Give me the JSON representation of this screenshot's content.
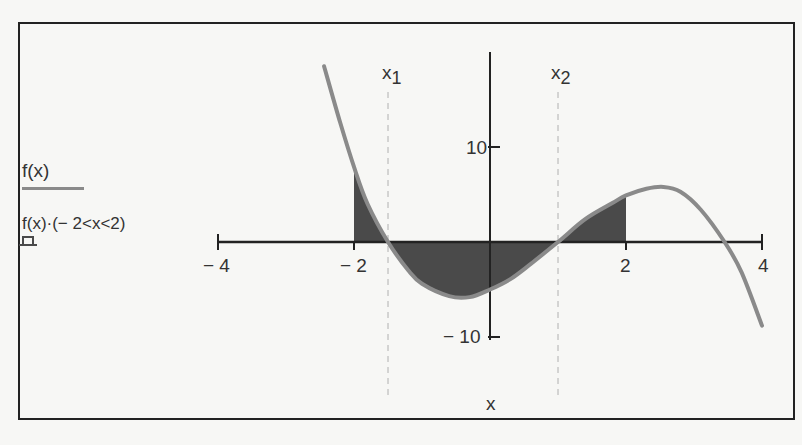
{
  "chart_data": {
    "type": "line",
    "title": "",
    "xlabel": "x",
    "ylabel": "",
    "xlim": [
      -4,
      4
    ],
    "ylim": [
      -10,
      20
    ],
    "grid": false,
    "x_ticks": [
      -4,
      -2,
      2,
      4
    ],
    "x_tick_labels": [
      "− 4",
      "− 2",
      "2",
      "4"
    ],
    "y_ticks": [
      10,
      -10
    ],
    "y_tick_labels": [
      "10",
      "− 10"
    ],
    "legend_position": "left",
    "markers": [
      {
        "name": "x1",
        "label_base": "x",
        "label_sub": "1",
        "x": -1.5,
        "style": "dashed"
      },
      {
        "name": "x2",
        "label_base": "x",
        "label_sub": "2",
        "x": 1.0,
        "style": "dashed"
      }
    ],
    "series": [
      {
        "name": "f(x)",
        "legend_label": "f(x)",
        "style": "line",
        "color": "#8a8a8a",
        "x": [
          -2.44,
          -2.2,
          -2.0,
          -1.8,
          -1.5,
          -1.2,
          -1.0,
          -0.6,
          -0.3,
          0.0,
          0.3,
          0.6,
          1.0,
          1.4,
          1.8,
          2.0,
          2.3,
          2.55,
          2.8,
          3.1,
          3.45,
          3.7,
          4.0
        ],
        "y": [
          18.5,
          12.5,
          7.9,
          4.0,
          0.0,
          -3.0,
          -4.4,
          -5.7,
          -5.8,
          -5.0,
          -3.9,
          -2.3,
          0.0,
          2.4,
          4.1,
          4.9,
          5.6,
          5.8,
          5.3,
          3.4,
          0.0,
          -3.2,
          -8.8
        ]
      },
      {
        "name": "f(x)·(−2<x<2)",
        "legend_label": "f(x)·(− 2<x<2)",
        "style": "filled-area",
        "color": "#4a4a4a",
        "x_range": [
          -2,
          2
        ]
      }
    ]
  },
  "legend": {
    "items": [
      {
        "label": "f(x)"
      },
      {
        "label": "f(x)·(− 2<x<2)"
      }
    ]
  },
  "colors": {
    "curve": "#8a8a8a",
    "fill": "#4a4a4a",
    "axis": "#222222",
    "marker": "#b0b0b0",
    "background": "#f7f7f5"
  }
}
